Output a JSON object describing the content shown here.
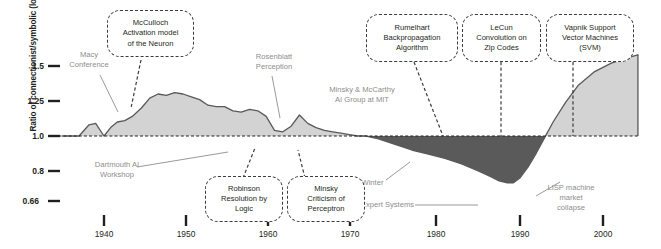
{
  "chart_data": {
    "type": "area",
    "title": "",
    "xlabel": "",
    "ylabel": "Ratio of connectionist/symbolic (log)",
    "ylim": [
      0.6,
      1.62
    ],
    "xlim": [
      1934,
      2004
    ],
    "grid": false,
    "legend": null,
    "baseline": 1.0,
    "y_ticks": [
      {
        "label": "1.5",
        "value": 1.5
      },
      {
        "label": "1.25",
        "value": 1.25
      },
      {
        "label": "1.0",
        "value": 1.0
      },
      {
        "label": "0.8",
        "value": 0.8
      },
      {
        "label": "0.66",
        "value": 0.66
      }
    ],
    "x_ticks": [
      {
        "label": "1940",
        "value": 1940
      },
      {
        "label": "1950",
        "value": 1950
      },
      {
        "label": "1960",
        "value": 1960
      },
      {
        "label": "1970",
        "value": 1970
      },
      {
        "label": "1980",
        "value": 1980
      },
      {
        "label": "1990",
        "value": 1990
      },
      {
        "label": "2000",
        "value": 2000
      }
    ],
    "series": [
      {
        "name": "Ratio of connectionist/symbolic research (log)",
        "x": [
          1935.0,
          1937.0,
          1938.2,
          1939.0,
          1940.0,
          1940.8,
          1941.6,
          1942.5,
          1943.4,
          1944.5,
          1945.5,
          1946.5,
          1947.5,
          1948.5,
          1949.5,
          1950.5,
          1951.5,
          1952.5,
          1953.5,
          1954.5,
          1955.5,
          1956.5,
          1957.5,
          1958.5,
          1959.5,
          1960.5,
          1961.5,
          1962.5,
          1963.5,
          1964.5,
          1965.5,
          1966.5,
          1967.5,
          1968.5,
          1969.5,
          1970.5,
          1971.5,
          1973.0,
          1975.0,
          1977.0,
          1979.0,
          1981.0,
          1983.0,
          1985.0,
          1986.5,
          1987.5,
          1988.5,
          1989.2,
          1990.0,
          1991.0,
          1992.0,
          1993.0,
          1994.0,
          1995.5,
          1997.0,
          1999.0,
          2001.0,
          2003.0,
          2004.2
        ],
        "y": [
          1.0,
          1.0,
          1.08,
          1.09,
          1.0,
          1.06,
          1.1,
          1.11,
          1.14,
          1.2,
          1.27,
          1.3,
          1.29,
          1.31,
          1.3,
          1.28,
          1.26,
          1.22,
          1.21,
          1.21,
          1.18,
          1.17,
          1.19,
          1.18,
          1.14,
          1.04,
          1.03,
          1.07,
          1.15,
          1.09,
          1.06,
          1.04,
          1.03,
          1.02,
          1.01,
          1.0,
          1.0,
          0.98,
          0.94,
          0.9,
          0.87,
          0.84,
          0.8,
          0.75,
          0.71,
          0.68,
          0.665,
          0.665,
          0.7,
          0.78,
          0.88,
          0.99,
          1.1,
          1.24,
          1.36,
          1.46,
          1.52,
          1.56,
          1.58
        ],
        "fill_above_baseline_color": "#d3d3d3",
        "fill_below_baseline_color": "#5a5a5a",
        "line_color": "#58595b"
      }
    ],
    "annotations": [
      {
        "id": "macy-conference",
        "style": "plain",
        "text": "Macy\nConference",
        "x": 1938.5,
        "y": 1.45
      },
      {
        "id": "mcculloch-activation-model",
        "style": "callout",
        "text": "McCulloch\nActivation model\nof the Neuron",
        "x": 1945.0,
        "y": 1.58
      },
      {
        "id": "rosenblatt-perception",
        "style": "plain",
        "text": "Rosenblatt\nPerception",
        "x": 1958.5,
        "y": 1.39
      },
      {
        "id": "dartmouth-ai-workshop",
        "style": "plain",
        "text": "Dartmouth AI\nWorkshop",
        "x": 1942.5,
        "y": 0.83
      },
      {
        "id": "robinson-resolution-by-logic",
        "style": "callout",
        "text": "Robinson\nResolution by\nLogic",
        "x": 1954.0,
        "y": 0.76
      },
      {
        "id": "minsky-criticism-of-perceptron",
        "style": "callout",
        "text": "Minsky\nCriticism of\nPerceptron",
        "x": 1963.5,
        "y": 0.76
      },
      {
        "id": "minsky-mccarthy-ai-group-mit",
        "style": "plain",
        "text": "Minsky & McCarthy\nAI Group at MIT",
        "x": 1973.0,
        "y": 1.27
      },
      {
        "id": "first-ai-winter",
        "style": "plain",
        "text": "1ˢᵗ AI Winter",
        "x": 1973.0,
        "y": 0.82
      },
      {
        "id": "rumelhart-backpropagation",
        "style": "callout",
        "text": "Rumelhart\nBackpropagation\nAlgorithm",
        "x": 1981.0,
        "y": 1.56
      },
      {
        "id": "lecun-convolution-zip-codes",
        "style": "callout",
        "text": "LeCun\nConvolution on\nZip Codes",
        "x": 1989.0,
        "y": 1.56
      },
      {
        "id": "vapnik-support-vector-machines",
        "style": "callout",
        "text": "Vapnik Support\nVector Machines\n(SVM)",
        "x": 1997.0,
        "y": 1.56
      },
      {
        "id": "expert-systems",
        "style": "plain",
        "text": "Expert Systems",
        "x": 1981.5,
        "y": 0.695
      },
      {
        "id": "lisp-machine-market-collapse",
        "style": "plain",
        "text": "LISP machine\nmarket\ncollapse",
        "x": 1994.5,
        "y": 0.78
      }
    ]
  },
  "labels": {
    "y_axis_title": "Ratio of connectionist/symbolic (log)",
    "y_tick_15": "1.5",
    "y_tick_125": "1.25",
    "y_tick_10": "1.0",
    "y_tick_08": "0.8",
    "y_tick_066": "0.66",
    "x_tick_1940": "1940",
    "x_tick_1950": "1950",
    "x_tick_1960": "1960",
    "x_tick_1970": "1970",
    "x_tick_1980": "1980",
    "x_tick_1990": "1990",
    "x_tick_2000": "2000",
    "macy_line1": "Macy",
    "macy_line2": "Conference",
    "mcculloch_line1": "McCulloch",
    "mcculloch_line2": "Activation model",
    "mcculloch_line3": "of the Neuron",
    "rosenblatt_line1": "Rosenblatt",
    "rosenblatt_line2": "Perception",
    "dartmouth_line1": "Dartmouth AI",
    "dartmouth_line2": "Workshop",
    "robinson_line1": "Robinson",
    "robinson_line2": "Resolution by",
    "robinson_line3": "Logic",
    "minsky_crit_line1": "Minsky",
    "minsky_crit_line2": "Criticism of",
    "minsky_crit_line3": "Perceptron",
    "mit_line1": "Minsky & McCarthy",
    "mit_line2": "AI Group at MIT",
    "ai_winter": "AI Winter",
    "ai_winter_prefix": "1",
    "ai_winter_sup": "st",
    "rumelhart_line1": "Rumelhart",
    "rumelhart_line2": "Backpropagation",
    "rumelhart_line3": "Algorithm",
    "lecun_line1": "LeCun",
    "lecun_line2": "Convolution on",
    "lecun_line3": "Zip Codes",
    "vapnik_line1": "Vapnik Support",
    "vapnik_line2": "Vector Machines",
    "vapnik_line3": "(SVM)",
    "expert_systems": "Expert Systems",
    "lisp_line1": "LISP machine",
    "lisp_line2": "market",
    "lisp_line3": "collapse"
  },
  "colors": {
    "fill_light": "#d3d3d3",
    "fill_dark": "#5a5a5a",
    "line": "#58595b",
    "text_dark": "#231f20",
    "text_gray": "#8d8d8d",
    "callout_border": "#3b3b3b"
  }
}
